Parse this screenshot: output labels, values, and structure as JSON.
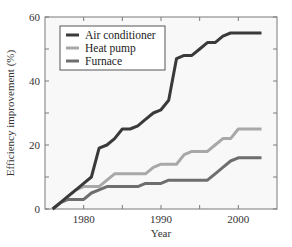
{
  "chart_data": {
    "type": "line",
    "title": "",
    "xlabel": "Year",
    "ylabel": "Efficiency improvement (%)",
    "xlim": [
      1975,
      2005
    ],
    "ylim": [
      0,
      60
    ],
    "xticks": [
      1980,
      1990,
      2000
    ],
    "xtick_labels": [
      "1980",
      "1990",
      "2000"
    ],
    "yticks": [
      0,
      20,
      40,
      60
    ],
    "ytick_labels": [
      "0",
      "20",
      "40",
      "60"
    ],
    "grid": false,
    "legend_position": "upper left",
    "series": [
      {
        "name": "Air conditioner",
        "color": "#3a3a3a",
        "x": [
          1976,
          1977,
          1978,
          1979,
          1980,
          1981,
          1982,
          1983,
          1984,
          1985,
          1986,
          1987,
          1988,
          1989,
          1990,
          1991,
          1992,
          1993,
          1994,
          1995,
          1996,
          1997,
          1998,
          1999,
          2000,
          2001,
          2002,
          2003
        ],
        "y": [
          0,
          2,
          4,
          6,
          8,
          10,
          19,
          20,
          22,
          25,
          25,
          26,
          28,
          30,
          31,
          34,
          47,
          48,
          48,
          50,
          52,
          52,
          54,
          55,
          55,
          55,
          55,
          55
        ]
      },
      {
        "name": "Heat pump",
        "color": "#a8a8a8",
        "x": [
          1976,
          1977,
          1978,
          1979,
          1980,
          1981,
          1982,
          1983,
          1984,
          1985,
          1986,
          1987,
          1988,
          1989,
          1990,
          1991,
          1992,
          1993,
          1994,
          1995,
          1996,
          1997,
          1998,
          1999,
          2000,
          2001,
          2002,
          2003
        ],
        "y": [
          0,
          2,
          4,
          6,
          7,
          7,
          7,
          9,
          11,
          11,
          11,
          11,
          11,
          13,
          14,
          14,
          14,
          17,
          18,
          18,
          18,
          20,
          22,
          22,
          25,
          25,
          25,
          25
        ]
      },
      {
        "name": "Furnace",
        "color": "#6e6e6e",
        "x": [
          1976,
          1977,
          1978,
          1979,
          1980,
          1981,
          1982,
          1983,
          1984,
          1985,
          1986,
          1987,
          1988,
          1989,
          1990,
          1991,
          1992,
          1993,
          1994,
          1995,
          1996,
          1997,
          1998,
          1999,
          2000,
          2001,
          2002,
          2003
        ],
        "y": [
          0,
          2,
          3,
          3,
          3,
          5,
          6,
          7,
          7,
          7,
          7,
          7,
          8,
          8,
          8,
          9,
          9,
          9,
          9,
          9,
          9,
          11,
          13,
          15,
          16,
          16,
          16,
          16
        ]
      }
    ]
  }
}
